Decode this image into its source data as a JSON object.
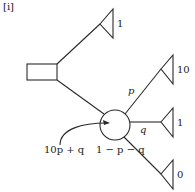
{
  "panel_label": "[i]",
  "colors": {
    "stroke": "#2a2a2a",
    "background": "#ffffff"
  },
  "nodes": {
    "decision": {
      "type": "decision-square",
      "x": 27,
      "y": 64,
      "width": 30,
      "height": 16
    },
    "chance": {
      "type": "chance-circle",
      "cx": 115,
      "cy": 125,
      "r": 15
    }
  },
  "terminals": [
    {
      "id": "top",
      "payoff": "1",
      "tip_x": 100,
      "tip_y": 24,
      "back_x": 113,
      "top_y": 9,
      "bottom_y": 38
    },
    {
      "id": "p-branch",
      "payoff": "10",
      "tip_x": 161,
      "tip_y": 69,
      "back_x": 173,
      "top_y": 55,
      "bottom_y": 84
    },
    {
      "id": "q-branch",
      "payoff": "1",
      "tip_x": 161,
      "tip_y": 122,
      "back_x": 173,
      "top_y": 108,
      "bottom_y": 137
    },
    {
      "id": "rest-branch",
      "payoff": "0",
      "tip_x": 161,
      "tip_y": 174,
      "back_x": 173,
      "top_y": 160,
      "bottom_y": 189
    }
  ],
  "edges": [
    {
      "from": "decision-top-right",
      "to": "top-terminal",
      "x1": 57,
      "y1": 64,
      "x2": 100,
      "y2": 24
    },
    {
      "from": "decision-bottom-right",
      "to": "chance",
      "x1": 57,
      "y1": 80,
      "x2": 104,
      "y2": 114
    },
    {
      "from": "chance",
      "to": "p-terminal",
      "x1": 125,
      "y1": 114,
      "x2": 161,
      "y2": 69,
      "label": "p"
    },
    {
      "from": "chance",
      "to": "q-terminal",
      "x1": 130,
      "y1": 122,
      "x2": 161,
      "y2": 122,
      "label": "q"
    },
    {
      "from": "chance",
      "to": "rest-terminal",
      "x1": 124,
      "y1": 137,
      "x2": 161,
      "y2": 174,
      "label": "1 − p − q"
    }
  ],
  "probability_labels": {
    "p": "p",
    "q": "q",
    "rest": "1 − p − q"
  },
  "payoff_labels": {
    "top": "1",
    "p_branch": "10",
    "q_branch": "1",
    "rest_branch": "0"
  },
  "expected_value": {
    "label": "10p + q",
    "arrow_from_x": 60,
    "arrow_from_y": 145,
    "arrow_to_x": 110,
    "arrow_to_y": 123
  }
}
